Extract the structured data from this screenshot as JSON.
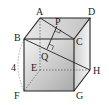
{
  "diagram": {
    "type": "cube",
    "vertices": {
      "A": {
        "label": "A",
        "x": 40,
        "y": 18
      },
      "B": {
        "label": "B",
        "x": 24,
        "y": 39
      },
      "C": {
        "label": "C",
        "x": 74,
        "y": 39
      },
      "D": {
        "label": "D",
        "x": 90,
        "y": 18
      },
      "E": {
        "label": "E",
        "x": 40,
        "y": 70
      },
      "F": {
        "label": "F",
        "x": 24,
        "y": 91
      },
      "G": {
        "label": "G",
        "x": 74,
        "y": 91
      },
      "H": {
        "label": "H",
        "x": 90,
        "y": 70
      }
    },
    "points": {
      "P": {
        "label": "P",
        "x": 57,
        "y": 26
      },
      "Q": {
        "label": "Q",
        "x": 47,
        "y": 49
      }
    },
    "edge_length_label": "4",
    "segments": [
      "AC",
      "BH",
      "PQ"
    ],
    "right_angle_marks": [
      "P",
      "Q"
    ]
  }
}
